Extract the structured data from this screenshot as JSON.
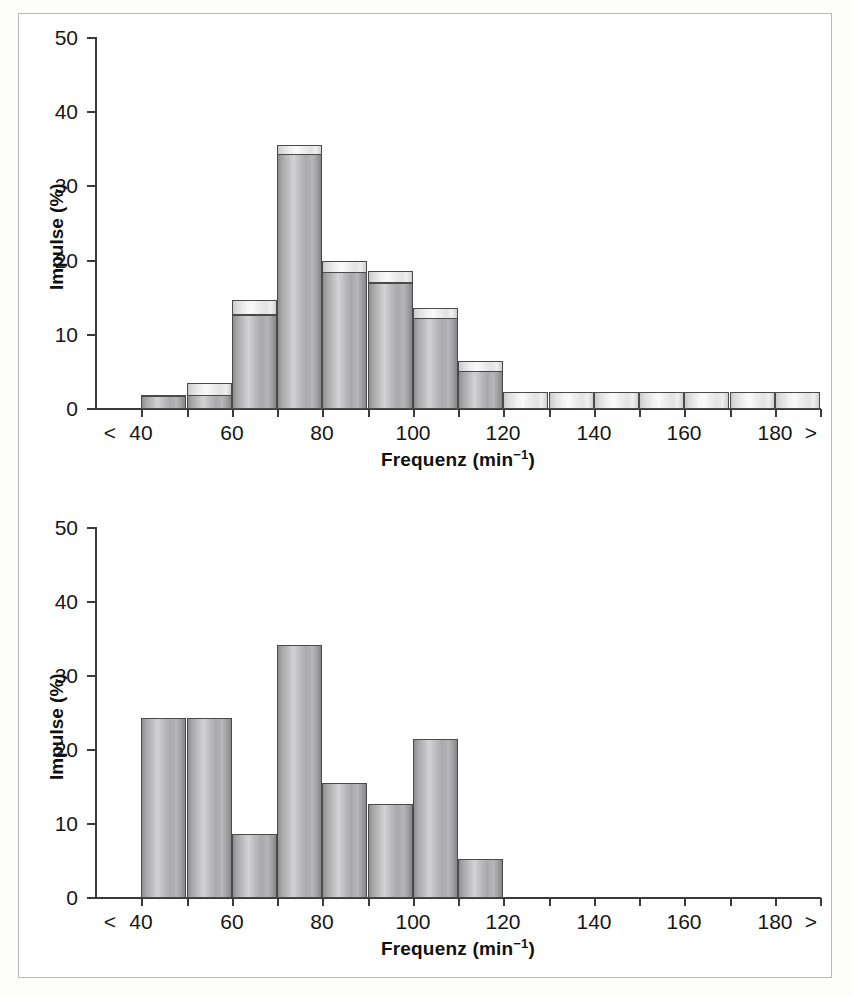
{
  "figure": {
    "background_color": "#ffffff",
    "frame_color": "#b9b9b9"
  },
  "charts": [
    {
      "id": "top-chart",
      "axis_title_x_main": "Frequenz (min",
      "axis_title_x_sup": "−1",
      "axis_title_x_close": ")",
      "axis_title_y": "Impulse (%)",
      "y_ticks": [
        "50",
        "40",
        "30",
        "20",
        "10",
        "0"
      ],
      "x_ticks": [
        "<",
        "40",
        "60",
        "80",
        "100",
        "120",
        "140",
        "160",
        "180",
        ">"
      ]
    },
    {
      "id": "bottom-chart",
      "axis_title_x_main": "Frequenz (min",
      "axis_title_x_sup": "−1",
      "axis_title_x_close": ")",
      "axis_title_y": "Impulse (%)",
      "y_ticks": [
        "50",
        "40",
        "30",
        "20",
        "10",
        "0"
      ],
      "x_ticks": [
        "<",
        "40",
        "60",
        "80",
        "100",
        "120",
        "140",
        "160",
        "180",
        ">"
      ]
    }
  ],
  "chart_data": [
    {
      "type": "bar",
      "id": "top-chart",
      "title": "",
      "xlabel": "Frequenz (min-1)",
      "ylabel": "Impulse (%)",
      "xlim": [
        30,
        190
      ],
      "ylim": [
        0,
        50
      ],
      "grid": false,
      "legend": null,
      "bin_width": 10,
      "note": "Histogram with cylindrical 3D bars; each bar has a lighter top cap. cap_value is the outer/top outline, body_value is the top of the shaded cylinder body.",
      "bins": [
        {
          "range": [
            30,
            40
          ],
          "label": "<40",
          "body_value": 0,
          "cap_value": 0
        },
        {
          "range": [
            40,
            50
          ],
          "label": "40-50",
          "body_value": 1.6,
          "cap_value": 1.8
        },
        {
          "range": [
            50,
            60
          ],
          "label": "50-60",
          "body_value": 1.7,
          "cap_value": 3.4
        },
        {
          "range": [
            60,
            70
          ],
          "label": "60-70",
          "body_value": 12.6,
          "cap_value": 14.5
        },
        {
          "range": [
            70,
            80
          ],
          "label": "70-80",
          "body_value": 34.2,
          "cap_value": 35.5
        },
        {
          "range": [
            80,
            90
          ],
          "label": "80-90",
          "body_value": 18.3,
          "cap_value": 19.8
        },
        {
          "range": [
            90,
            100
          ],
          "label": "90-100",
          "body_value": 16.9,
          "cap_value": 18.4
        },
        {
          "range": [
            100,
            110
          ],
          "label": "100-110",
          "body_value": 12.1,
          "cap_value": 13.5
        },
        {
          "range": [
            110,
            120
          ],
          "label": "110-120",
          "body_value": 5.0,
          "cap_value": 6.3
        },
        {
          "range": [
            120,
            130
          ],
          "label": "120-130",
          "body_value": 0,
          "cap_value": 2.1
        },
        {
          "range": [
            130,
            140
          ],
          "label": "130-140",
          "body_value": 0,
          "cap_value": 2.1
        },
        {
          "range": [
            140,
            150
          ],
          "label": "140-150",
          "body_value": 0,
          "cap_value": 2.1
        },
        {
          "range": [
            150,
            160
          ],
          "label": "150-160",
          "body_value": 0,
          "cap_value": 2.1
        },
        {
          "range": [
            160,
            170
          ],
          "label": "160-170",
          "body_value": 0,
          "cap_value": 2.1
        },
        {
          "range": [
            170,
            180
          ],
          "label": "170-180",
          "body_value": 0,
          "cap_value": 2.1
        },
        {
          "range": [
            180,
            190
          ],
          "label": "180->",
          "body_value": 0,
          "cap_value": 2.1
        }
      ]
    },
    {
      "type": "bar",
      "id": "bottom-chart",
      "title": "",
      "xlabel": "Frequenz (min-1)",
      "ylabel": "Impulse (%)",
      "xlim": [
        30,
        190
      ],
      "ylim": [
        0,
        50
      ],
      "grid": false,
      "legend": null,
      "bin_width": 10,
      "note": "Histogram with cylindrical 3D bars, no top caps.",
      "bins": [
        {
          "range": [
            30,
            40
          ],
          "label": "<40",
          "body_value": 0,
          "cap_value": 0
        },
        {
          "range": [
            40,
            50
          ],
          "label": "40-50",
          "body_value": 24.2,
          "cap_value": 0
        },
        {
          "range": [
            50,
            60
          ],
          "label": "50-60",
          "body_value": 24.2,
          "cap_value": 0
        },
        {
          "range": [
            60,
            70
          ],
          "label": "60-70",
          "body_value": 8.5,
          "cap_value": 0
        },
        {
          "range": [
            70,
            80
          ],
          "label": "70-80",
          "body_value": 34.0,
          "cap_value": 0
        },
        {
          "range": [
            80,
            90
          ],
          "label": "80-90",
          "body_value": 15.4,
          "cap_value": 0
        },
        {
          "range": [
            90,
            100
          ],
          "label": "90-100",
          "body_value": 12.6,
          "cap_value": 0
        },
        {
          "range": [
            100,
            110
          ],
          "label": "100-110",
          "body_value": 21.3,
          "cap_value": 0
        },
        {
          "range": [
            110,
            120
          ],
          "label": "110-120",
          "body_value": 5.2,
          "cap_value": 0
        },
        {
          "range": [
            120,
            130
          ],
          "label": "120-130",
          "body_value": 0,
          "cap_value": 0
        },
        {
          "range": [
            130,
            140
          ],
          "label": "130-140",
          "body_value": 0,
          "cap_value": 0
        },
        {
          "range": [
            140,
            150
          ],
          "label": "140-150",
          "body_value": 0,
          "cap_value": 0
        },
        {
          "range": [
            150,
            160
          ],
          "label": "150-160",
          "body_value": 0,
          "cap_value": 0
        },
        {
          "range": [
            160,
            170
          ],
          "label": "160-170",
          "body_value": 0,
          "cap_value": 0
        },
        {
          "range": [
            170,
            180
          ],
          "label": "170-180",
          "body_value": 0,
          "cap_value": 0
        },
        {
          "range": [
            180,
            190
          ],
          "label": "180->",
          "body_value": 0,
          "cap_value": 0
        }
      ]
    }
  ]
}
